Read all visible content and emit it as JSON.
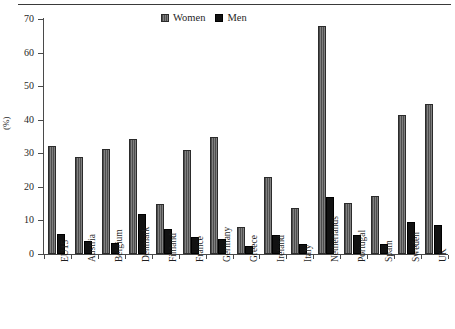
{
  "chart_data": {
    "type": "bar",
    "title": "",
    "xlabel": "",
    "ylabel": "(%)",
    "ylim": [
      0,
      70
    ],
    "ytick_step": 10,
    "yticks": [
      0,
      10,
      20,
      30,
      40,
      50,
      60,
      70
    ],
    "grid": false,
    "legend_position": "top-center",
    "categories": [
      "EU15",
      "Austria",
      "Belgium",
      "Denmark",
      "Finland",
      "France",
      "Germany",
      "Greece",
      "Ireland",
      "Italy",
      "Netherlands",
      "Portugal",
      "Spain",
      "Sweden",
      "UK"
    ],
    "series": [
      {
        "name": "Women",
        "color": "#6e6e6e",
        "values": [
          32.3,
          28.8,
          31.3,
          34.2,
          15.0,
          30.9,
          34.8,
          8.1,
          23.0,
          13.6,
          68.0,
          15.1,
          17.4,
          41.4,
          44.7
        ]
      },
      {
        "name": "Men",
        "color": "#121212",
        "values": [
          6.1,
          3.9,
          3.2,
          11.9,
          7.6,
          5.0,
          4.4,
          2.5,
          5.6,
          3.1,
          17.0,
          5.6,
          2.9,
          9.4,
          8.6
        ]
      }
    ]
  },
  "legend": {
    "entries": [
      {
        "label": "Women",
        "swatch": "women-swatch"
      },
      {
        "label": "Men",
        "swatch": "men-swatch"
      }
    ]
  },
  "axes": {
    "y_title": "(%)"
  }
}
